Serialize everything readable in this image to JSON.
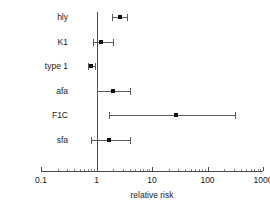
{
  "chart_data": {
    "type": "scatter",
    "subtype": "forest-plot",
    "title": "",
    "xlabel": "relative risk",
    "ylabel": "",
    "xscale": "log",
    "xlim": [
      0.1,
      1000
    ],
    "xticks": [
      0.1,
      1,
      10,
      100,
      1000
    ],
    "xtick_labels": [
      "0.1",
      "1",
      "10",
      "100",
      "1000"
    ],
    "grid": false,
    "legend": null,
    "reference_line": 1,
    "categories": [
      "hly",
      "K1",
      "type 1",
      "afa",
      "F1C",
      "sfa"
    ],
    "values": [
      2.6,
      1.2,
      0.8,
      2.0,
      27,
      1.7
    ],
    "ci_low": [
      1.9,
      0.85,
      0.7,
      1.0,
      1.7,
      0.8
    ],
    "ci_high": [
      3.5,
      2.0,
      0.95,
      4.0,
      310,
      4.0
    ],
    "points": [
      {
        "category": "hly",
        "value": 2.6,
        "ci_low": 1.9,
        "ci_high": 3.5
      },
      {
        "category": "K1",
        "value": 1.2,
        "ci_low": 0.85,
        "ci_high": 2.0
      },
      {
        "category": "type 1",
        "value": 0.8,
        "ci_low": 0.7,
        "ci_high": 0.95
      },
      {
        "category": "afa",
        "value": 2.0,
        "ci_low": 1.0,
        "ci_high": 4.0
      },
      {
        "category": "F1C",
        "value": 27,
        "ci_low": 1.7,
        "ci_high": 310
      },
      {
        "category": "sfa",
        "value": 1.7,
        "ci_low": 0.8,
        "ci_high": 4.0
      }
    ]
  },
  "colors": {
    "background": "#ffffff",
    "axis": "#4a4a4a",
    "marker": "#0d0d0d",
    "error_bar": "#5a5a5a",
    "text": "#1a1a1a"
  }
}
